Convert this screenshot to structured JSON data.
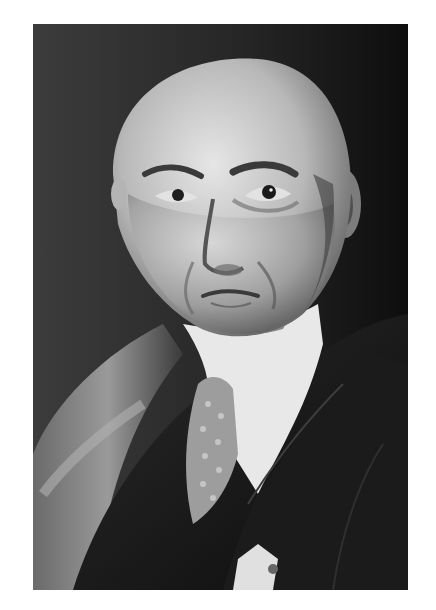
{
  "page": {
    "background": "#ffffff"
  },
  "photo": {
    "subject": "black-and-white portrait of a bald middle-aged man in a dark velvet suit jacket, white high-collared shirt and patterned tie",
    "style": "monochrome studio photograph",
    "colors": {
      "background_dark": "#141414",
      "background_mid": "#3a3a3a",
      "skin_light": "#d9d9d9",
      "skin_shadow": "#7a7a7a",
      "jacket": "#161616",
      "collar": "#eeeeee"
    }
  },
  "caption": {
    "text": ""
  }
}
